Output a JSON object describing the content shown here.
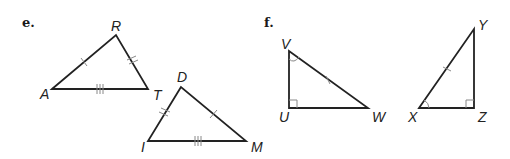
{
  "parts": [
    {
      "label": "e.",
      "triangles": [
        {
          "name": "ART",
          "vertices": {
            "A": "A",
            "R": "R",
            "T": "T"
          },
          "marks": {
            "AR": "single tick",
            "RT": "double tick",
            "AT": "triple tick"
          }
        },
        {
          "name": "DIM",
          "vertices": {
            "D": "D",
            "I": "I",
            "M": "M"
          },
          "marks": {
            "DM": "single tick",
            "DI": "double tick",
            "IM": "triple tick"
          }
        }
      ]
    },
    {
      "label": "f.",
      "triangles": [
        {
          "name": "VUW",
          "vertices": {
            "V": "V",
            "U": "U",
            "W": "W"
          },
          "marks": {
            "VW": "single tick",
            "U": "right angle",
            "V": "angle arc"
          }
        },
        {
          "name": "XYZ",
          "vertices": {
            "X": "X",
            "Y": "Y",
            "Z": "Z"
          },
          "marks": {
            "XY": "single tick",
            "Z": "right angle",
            "X": "angle arc"
          }
        }
      ]
    }
  ],
  "colors": {
    "line": "#222222",
    "mark": "#888888",
    "background": "#ffffff"
  }
}
